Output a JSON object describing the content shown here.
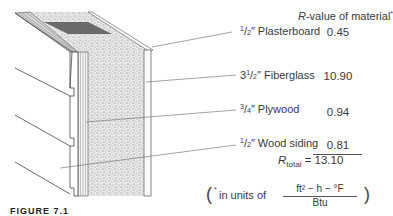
{
  "header": {
    "r_label": "R",
    "r_rest": "-value of material",
    "asterisk": "*"
  },
  "layers": [
    {
      "thickness_whole": "",
      "thickness_num": "1",
      "thickness_den": "2",
      "unit": "″",
      "name": "Plasterboard",
      "r_value": "0.45"
    },
    {
      "thickness_whole": "3",
      "thickness_num": "1",
      "thickness_den": "2",
      "unit": "″",
      "name": "Fiberglass",
      "r_value": "10.90"
    },
    {
      "thickness_whole": "",
      "thickness_num": "3",
      "thickness_den": "4",
      "unit": "″",
      "name": "Plywood",
      "r_value": "0.94"
    },
    {
      "thickness_whole": "",
      "thickness_num": "1",
      "thickness_den": "2",
      "unit": "″",
      "name": "Wood siding",
      "r_value": "0.81"
    }
  ],
  "total": {
    "label": "R",
    "subscript": "total",
    "equals": "=",
    "value": "13.10"
  },
  "units_note": {
    "open": "(",
    "asterisk": "*",
    "text": "in units of",
    "numerator": "ft² − h − °F",
    "denominator": "Btu",
    "close": ")"
  },
  "caption": "FIGURE 7.1"
}
